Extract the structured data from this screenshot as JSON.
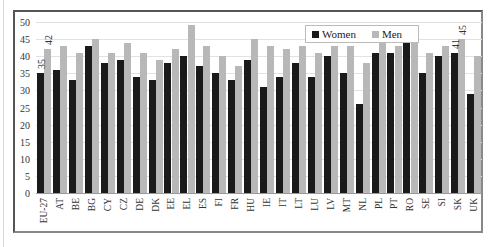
{
  "chart_data": {
    "type": "bar",
    "title": "",
    "xlabel": "",
    "ylabel": "",
    "ylim": [
      0,
      50
    ],
    "yticks": [
      0,
      5,
      10,
      15,
      20,
      25,
      30,
      35,
      40,
      45,
      50
    ],
    "grid": true,
    "legend_position": "top-right (inside)",
    "categories": [
      "EU-27",
      "AT",
      "BE",
      "BG",
      "CY",
      "CZ",
      "DE",
      "DK",
      "EE",
      "EL",
      "ES",
      "FI",
      "FR",
      "HU",
      "IE",
      "IT",
      "LT",
      "LU",
      "LV",
      "MT",
      "NL",
      "PL",
      "PT",
      "RO",
      "SE",
      "SI",
      "SK",
      "UK"
    ],
    "series": [
      {
        "name": "Women",
        "color": "#1a1a1a",
        "values": [
          35,
          36,
          33,
          43,
          38,
          39,
          34,
          33,
          38,
          40,
          37,
          35,
          33,
          39,
          31,
          34,
          38,
          34,
          40,
          35,
          26,
          41,
          41,
          44,
          35,
          40,
          41,
          29
        ]
      },
      {
        "name": "Men",
        "color": "#b8b8b8",
        "values": [
          42,
          43,
          41,
          45,
          41,
          44,
          41,
          39,
          42,
          49,
          43,
          40,
          37,
          45,
          43,
          42,
          43,
          41,
          43,
          43,
          38,
          47,
          43,
          48,
          41,
          43,
          45,
          40
        ]
      }
    ],
    "annotations": [
      {
        "category": "EU-27",
        "series": "Women",
        "label": "35"
      },
      {
        "category": "EU-27",
        "series": "Men",
        "label": "42"
      },
      {
        "category": "SK",
        "series": "Women",
        "label": "41"
      },
      {
        "category": "SK",
        "series": "Men",
        "label": "45"
      }
    ]
  },
  "legend": {
    "women": "Women",
    "men": "Men"
  }
}
